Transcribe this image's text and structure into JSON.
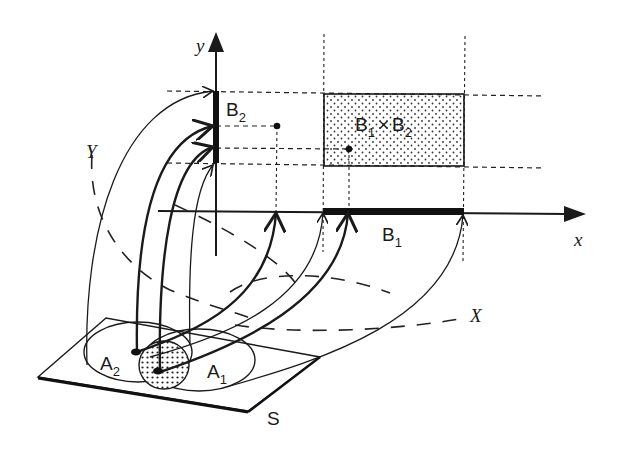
{
  "figure": {
    "type": "product-set mapping diagram",
    "colors": {
      "ink": "#1a1a1a",
      "background": "#ffffff"
    }
  },
  "axes": {
    "x_label": "x",
    "y_label": "y"
  },
  "labels": {
    "B2": {
      "base": "B",
      "sub": "2"
    },
    "B1": {
      "base": "B",
      "sub": "1"
    },
    "product": {
      "b1_base": "B",
      "b1_sub": "1",
      "times": "×",
      "b2_base": "B",
      "b2_sub": "2"
    },
    "A1": {
      "base": "A",
      "sub": "1"
    },
    "A2": {
      "base": "A",
      "sub": "2"
    },
    "S": "S",
    "X": "X",
    "Y": "Y"
  }
}
